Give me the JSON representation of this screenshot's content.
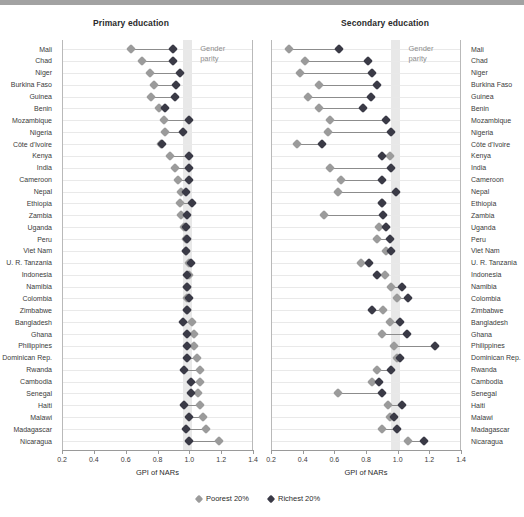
{
  "chart_data": {
    "type": "scatter",
    "title": "",
    "xlabel": "GPI of NARs",
    "ylabel": "",
    "xlim": [
      0.2,
      1.4
    ],
    "xticks": [
      0.2,
      0.4,
      0.6,
      0.8,
      1.0,
      1.2,
      1.4
    ],
    "xticklabels": [
      "0.2",
      "0.4",
      "0.6",
      "0.8",
      "1.0",
      "1.2",
      "1.4"
    ],
    "grid": true,
    "legend_position": "bottom",
    "annotation": "Gender parity",
    "parity_band": [
      0.96,
      1.02
    ],
    "legend": [
      {
        "name": "Poorest 20%",
        "color": "#9b9b9b"
      },
      {
        "name": "Richest 20%",
        "color": "#3a3a46"
      }
    ],
    "categories": [
      "Mali",
      "Chad",
      "Niger",
      "Burkina Faso",
      "Guinea",
      "Benin",
      "Mozambique",
      "Nigeria",
      "Côte d'Ivoire",
      "Kenya",
      "India",
      "Cameroon",
      "Nepal",
      "Ethiopia",
      "Zambia",
      "Uganda",
      "Peru",
      "Viet Nam",
      "U. R. Tanzania",
      "Indonesia",
      "Namibia",
      "Colombia",
      "Zimbabwe",
      "Bangladesh",
      "Ghana",
      "Philippines",
      "Dominican Rep.",
      "Rwanda",
      "Cambodia",
      "Senegal",
      "Haiti",
      "Malawi",
      "Madagascar",
      "Nicaragua"
    ],
    "panels": [
      {
        "id": "primary",
        "title": "Primary education",
        "series": [
          {
            "name": "Poorest 20%",
            "color": "#9b9b9b",
            "values": [
              0.63,
              0.7,
              0.75,
              0.78,
              0.76,
              0.81,
              0.84,
              0.85,
              0.82,
              0.88,
              0.91,
              0.93,
              0.95,
              0.94,
              0.95,
              0.97,
              0.98,
              0.98,
              1.0,
              1.0,
              0.99,
              0.99,
              0.99,
              1.02,
              1.03,
              1.03,
              1.05,
              1.07,
              1.07,
              1.06,
              1.07,
              1.09,
              1.11,
              1.19
            ]
          },
          {
            "name": "Richest 20%",
            "color": "#3a3a46",
            "values": [
              0.9,
              0.9,
              0.94,
              0.92,
              0.91,
              0.85,
              1.0,
              0.96,
              0.83,
              1.0,
              1.0,
              1.0,
              0.98,
              1.02,
              0.99,
              0.98,
              0.99,
              0.98,
              1.01,
              0.99,
              0.99,
              1.0,
              0.99,
              0.96,
              0.99,
              0.99,
              0.99,
              0.97,
              1.01,
              1.01,
              0.97,
              1.0,
              0.98,
              1.0
            ]
          }
        ]
      },
      {
        "id": "secondary",
        "title": "Secondary education",
        "series": [
          {
            "name": "Poorest 20%",
            "color": "#9b9b9b",
            "values": [
              0.31,
              0.41,
              0.38,
              0.5,
              0.43,
              0.5,
              0.57,
              0.56,
              0.36,
              0.95,
              0.57,
              0.64,
              0.62,
              0.9,
              0.53,
              0.88,
              0.87,
              0.93,
              0.77,
              0.92,
              0.96,
              1.0,
              0.91,
              0.95,
              0.9,
              0.98,
              1.0,
              0.87,
              0.84,
              0.62,
              0.94,
              0.95,
              0.9,
              1.07
            ]
          },
          {
            "name": "Richest 20%",
            "color": "#3a3a46",
            "values": [
              0.63,
              0.81,
              0.84,
              0.87,
              0.83,
              0.78,
              0.93,
              0.96,
              0.52,
              0.9,
              0.96,
              0.9,
              0.99,
              0.9,
              0.91,
              0.93,
              0.95,
              0.96,
              0.82,
              0.87,
              1.03,
              1.07,
              0.84,
              1.02,
              1.06,
              1.24,
              1.02,
              0.96,
              0.88,
              0.9,
              1.03,
              0.98,
              1.0,
              1.17
            ]
          }
        ]
      }
    ]
  },
  "legend": {
    "poorest_label": "Poorest 20%",
    "richest_label": "Richest 20%"
  },
  "axis": {
    "title": "GPI of NARs"
  },
  "annotation": {
    "line1": "Gender",
    "line2": "parity"
  },
  "panels": {
    "primary_title": "Primary education",
    "secondary_title": "Secondary education"
  }
}
